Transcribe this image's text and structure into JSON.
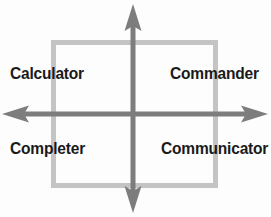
{
  "diagram": {
    "canvas": {
      "width": 271,
      "height": 217,
      "background": "#fdfdfd"
    },
    "frame": {
      "name": "quadrant-square",
      "x": 51,
      "y": 40,
      "width": 167,
      "height": 148,
      "stroke": "#c4c4c4",
      "stroke_width": 5
    },
    "axes": {
      "stroke": "#7d7d7d",
      "stroke_width": 5,
      "center": {
        "x": 133,
        "y": 114
      },
      "vertical": {
        "top": 4,
        "bottom": 213
      },
      "horizontal": {
        "left": 2,
        "right": 268
      },
      "arrowheads": [
        "up",
        "down",
        "left",
        "right"
      ]
    },
    "quadrants": [
      {
        "id": "top-left",
        "label": "Calculator"
      },
      {
        "id": "top-right",
        "label": "Commander"
      },
      {
        "id": "bottom-left",
        "label": "Completer"
      },
      {
        "id": "bottom-right",
        "label": "Communicator"
      }
    ],
    "label_color": "#1a1a1a"
  }
}
